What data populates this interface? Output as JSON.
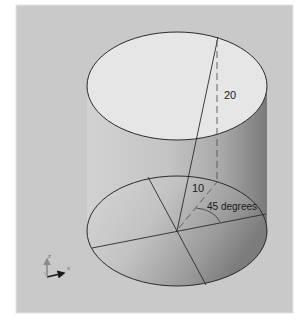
{
  "diagram": {
    "type": "cylinder-with-coordinates",
    "labels": {
      "height": "20",
      "radius": "10",
      "angle": "45 degrees"
    },
    "axes": {
      "vertical": "z",
      "horizontal": "x"
    },
    "colors": {
      "background": "#c9c9c9",
      "frame_border": "#e4e4e4",
      "top_face": "#e6e6e6",
      "line": "#2a2a2a",
      "axis_arrow": "#1a1a1a",
      "axis_z": "#8a8a8a"
    }
  }
}
